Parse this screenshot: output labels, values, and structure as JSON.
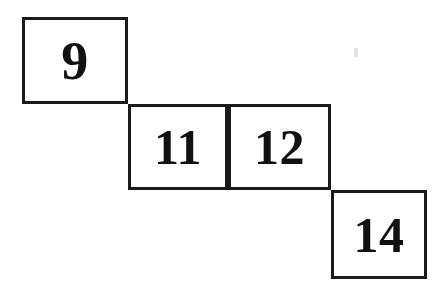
{
  "figure": {
    "background_color": "#ffffff",
    "border_color": "#1a1a1a",
    "text_color": "#111111",
    "cells": [
      {
        "label": "9",
        "row": 1,
        "column": 1
      },
      {
        "label": "11",
        "row": 2,
        "column": 2
      },
      {
        "label": "12",
        "row": 2,
        "column": 3
      },
      {
        "label": "14",
        "row": 3,
        "column": 4
      }
    ]
  },
  "chart_data": {
    "type": "table",
    "categories": [
      "box-1",
      "box-2",
      "box-3",
      "box-4"
    ],
    "values": [
      9,
      11,
      12,
      14
    ],
    "xlabel": "",
    "ylabel": "",
    "grid": false,
    "legend": "none",
    "annotations": [
      "Boxes arranged in a descending staircase pattern",
      "Box 9 sits alone in the top-left step",
      "Boxes 11 and 12 share the middle step and are adjacent",
      "Box 14 sits alone in the bottom-right step"
    ]
  }
}
